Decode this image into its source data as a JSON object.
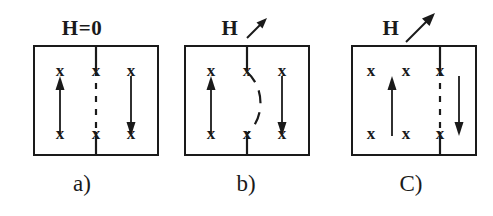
{
  "figure": {
    "background_color": "#ffffff",
    "ink_color": "#1a1a1a"
  },
  "panels": [
    {
      "id": "a",
      "caption": "a)",
      "field_label": "H=0",
      "field_arrow": "none",
      "wall_position": "center",
      "wall_style": "straight-dashed",
      "x_marks": [
        "x",
        "x",
        "x",
        "x",
        "x",
        "x"
      ],
      "domain_arrows": [
        {
          "name": "up-arrow",
          "direction": "up"
        },
        {
          "name": "down-arrow",
          "direction": "down"
        }
      ]
    },
    {
      "id": "b",
      "caption": "b)",
      "field_label": "H",
      "field_arrow": "diagonal-up-right-short",
      "wall_position": "center",
      "wall_style": "bowed-dashed",
      "x_marks": [
        "x",
        "x",
        "x",
        "x",
        "x",
        "x"
      ],
      "domain_arrows": [
        {
          "name": "up-arrow",
          "direction": "up"
        },
        {
          "name": "down-arrow",
          "direction": "down"
        }
      ]
    },
    {
      "id": "c",
      "caption": "C)",
      "field_label": "H",
      "field_arrow": "diagonal-up-right-long",
      "wall_position": "right",
      "wall_style": "straight-dashed",
      "x_marks": [
        "x",
        "x",
        "x",
        "x",
        "x",
        "x"
      ],
      "domain_arrows": [
        {
          "name": "up-arrow",
          "direction": "up"
        },
        {
          "name": "down-arrow",
          "direction": "down"
        }
      ]
    }
  ]
}
